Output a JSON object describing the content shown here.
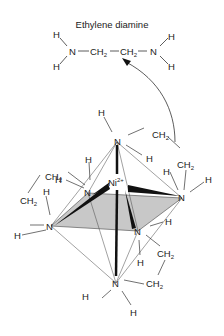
{
  "title": "Ethylene diamine",
  "molecule": {
    "atoms": [
      "H",
      "N",
      "CH2",
      "CH2",
      "N",
      "H",
      "H",
      "H"
    ],
    "formula_text": "H2N—CH2—CH2—NH2"
  },
  "complex": {
    "center": "Ni",
    "charge": "2+",
    "ligand_atoms": {
      "N": "N",
      "H": "H",
      "CH2": "CH",
      "sub2": "2"
    }
  }
}
